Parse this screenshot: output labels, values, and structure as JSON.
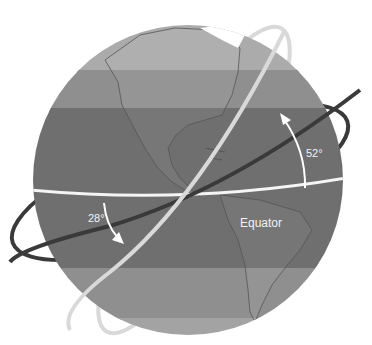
{
  "diagram": {
    "type": "orbital-inclination-globe",
    "labels": {
      "equator": "Equator",
      "angle_high": "52°",
      "angle_low": "28°"
    },
    "orbits": [
      {
        "name": "high-inclination-orbit",
        "inclination": "52°",
        "color": "#d9d9d9"
      },
      {
        "name": "low-inclination-orbit",
        "inclination": "28°",
        "color": "#3a3a3a"
      }
    ],
    "colors": {
      "band_polar": "#a9a9a9",
      "band_temperate": "#8c8c8c",
      "band_tropical": "#6e6e6e",
      "equator_line": "#f5f5f5",
      "arrows": "#ffffff",
      "land_outline": "#555555",
      "ice": "#ffffff"
    }
  }
}
